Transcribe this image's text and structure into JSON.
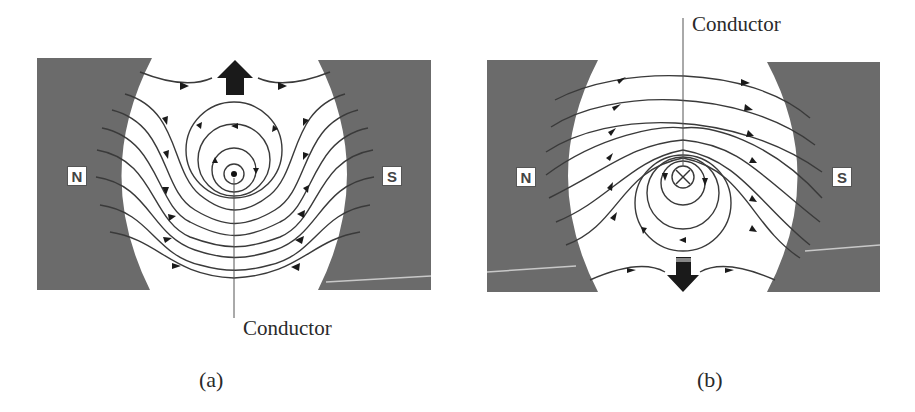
{
  "figure_a": {
    "caption": "(a)",
    "conductor_label": "Conductor",
    "conductor_symbol": "dot (current out of page)",
    "force_direction": "up",
    "pole_left": "N",
    "pole_right": "S"
  },
  "figure_b": {
    "caption": "(b)",
    "conductor_label": "Conductor",
    "conductor_symbol": "cross (current into page)",
    "force_direction": "down",
    "pole_left": "N",
    "pole_right": "S"
  },
  "colors": {
    "magnet": "#6b6b6b",
    "field_line": "#3a3a3a",
    "arrow": "#1a1a1a",
    "background": "#ffffff"
  }
}
